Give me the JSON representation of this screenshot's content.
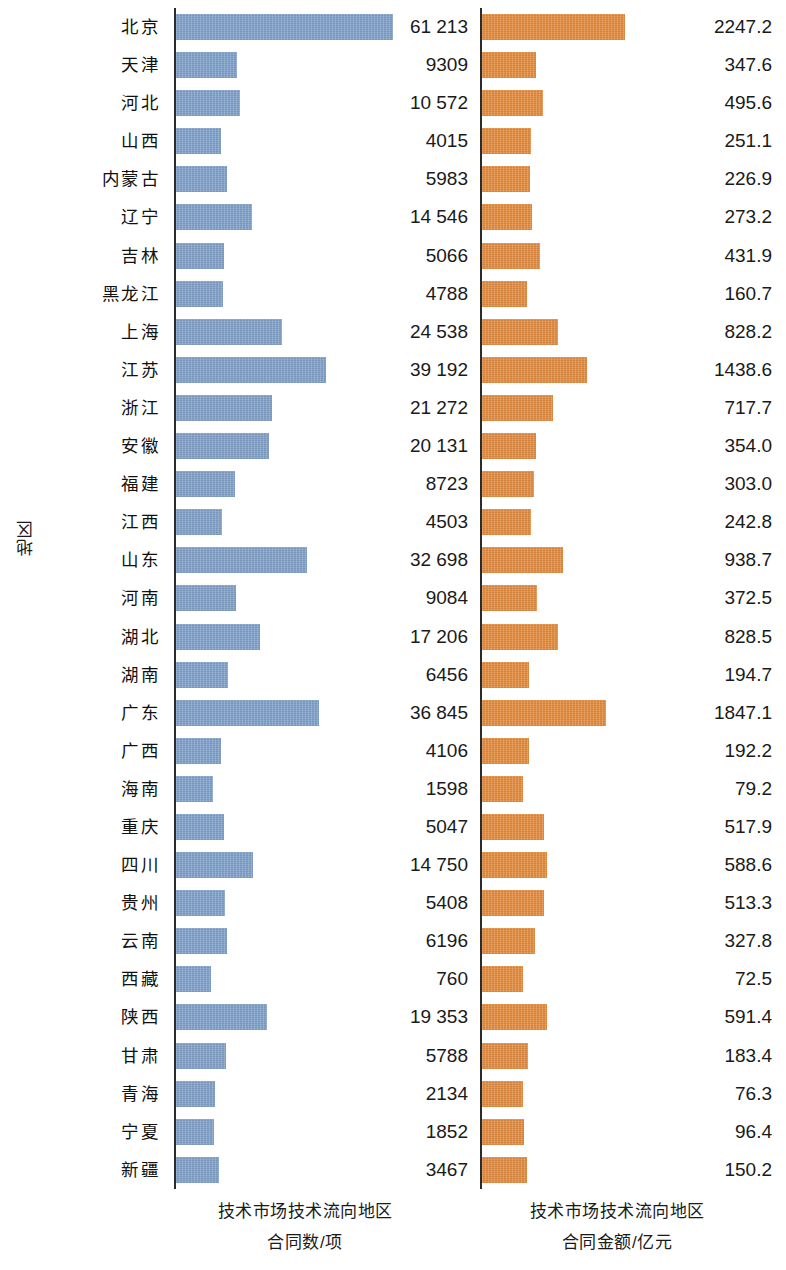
{
  "chart_data": {
    "type": "bar",
    "orientation": "horizontal",
    "title": "",
    "ylabel": "地区",
    "grid": false,
    "legend": false,
    "panels": [
      {
        "key": "count",
        "xlabel_line1": "技术市场技术流向地区",
        "xlabel_line2": "合同数/项",
        "unit": "项",
        "color": "#7f9fc7",
        "xlim": [
          0,
          61213
        ]
      },
      {
        "key": "amount",
        "xlabel_line1": "技术市场技术流向地区",
        "xlabel_line2": "合同金额/亿元",
        "unit": "亿元",
        "color": "#e08a3f",
        "xlim": [
          0,
          2247.2
        ]
      }
    ],
    "categories": [
      "北京",
      "天津",
      "河北",
      "山西",
      "内蒙古",
      "辽宁",
      "吉林",
      "黑龙江",
      "上海",
      "江苏",
      "浙江",
      "安徽",
      "福建",
      "江西",
      "山东",
      "河南",
      "湖北",
      "湖南",
      "广东",
      "广西",
      "海南",
      "重庆",
      "四川",
      "贵州",
      "云南",
      "西藏",
      "陕西",
      "甘肃",
      "青海",
      "宁夏",
      "新疆"
    ],
    "series": [
      {
        "name": "技术市场技术流向地区合同数/项",
        "key": "count",
        "values": [
          61213,
          9309,
          10572,
          4015,
          5983,
          14546,
          5066,
          4788,
          24538,
          39192,
          21272,
          20131,
          8723,
          4503,
          32698,
          9084,
          17206,
          6456,
          36845,
          4106,
          1598,
          5047,
          14750,
          5408,
          6196,
          760,
          19353,
          5788,
          2134,
          1852,
          3467
        ],
        "labels": [
          "61 213",
          "9309",
          "10 572",
          "4015",
          "5983",
          "14 546",
          "5066",
          "4788",
          "24 538",
          "39 192",
          "21 272",
          "20 131",
          "8723",
          "4503",
          "32 698",
          "9084",
          "17 206",
          "6456",
          "36 845",
          "4106",
          "1598",
          "5047",
          "14 750",
          "5408",
          "6196",
          "760",
          "19 353",
          "5788",
          "2134",
          "1852",
          "3467"
        ]
      },
      {
        "name": "技术市场技术流向地区合同金额/亿元",
        "key": "amount",
        "values": [
          2247.2,
          347.6,
          495.6,
          251.1,
          226.9,
          273.2,
          431.9,
          160.7,
          828.2,
          1438.6,
          717.7,
          354.0,
          303.0,
          242.8,
          938.7,
          372.5,
          828.5,
          194.7,
          1847.1,
          192.2,
          79.2,
          517.9,
          588.6,
          513.3,
          327.8,
          72.5,
          591.4,
          183.4,
          76.3,
          96.4,
          150.2
        ],
        "labels": [
          "2247.2",
          "347.6",
          "495.6",
          "251.1",
          "226.9",
          "273.2",
          "431.9",
          "160.7",
          "828.2",
          "1438.6",
          "717.7",
          "354.0",
          "303.0",
          "242.8",
          "938.7",
          "372.5",
          "828.5",
          "194.7",
          "1847.1",
          "192.2",
          "79.2",
          "517.9",
          "588.6",
          "513.3",
          "327.8",
          "72.5",
          "591.4",
          "183.4",
          "76.3",
          "96.4",
          "150.2"
        ]
      }
    ]
  }
}
